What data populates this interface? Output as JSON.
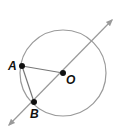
{
  "diagram": {
    "type": "geometry",
    "circle": {
      "center": "O",
      "cx": 63,
      "cy": 73,
      "r": 43,
      "stroke": "#9a9a9a"
    },
    "points": [
      {
        "name": "A",
        "x": 22,
        "y": 66,
        "label": "A"
      },
      {
        "name": "O",
        "x": 63,
        "y": 73,
        "label": "O"
      },
      {
        "name": "B",
        "x": 34,
        "y": 102,
        "label": "B"
      }
    ],
    "segments": [
      {
        "from": "A",
        "to": "O"
      },
      {
        "from": "A",
        "to": "B"
      }
    ],
    "line": {
      "through": [
        "B",
        "O"
      ],
      "arrows": "both",
      "stroke": "#9a9a9a"
    },
    "colors": {
      "point": "#111111",
      "circle": "#9a9a9a",
      "segment": "#777777"
    }
  }
}
